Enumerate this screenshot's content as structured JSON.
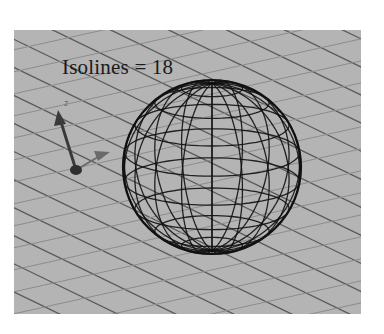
{
  "figure": {
    "caption": "Isolines = 18",
    "isolines": 18,
    "object": "wireframe-sphere",
    "colors": {
      "background": "#ffffff",
      "ground_plane": "#b4b4b4",
      "grid_dark": "#5a5a5a",
      "grid_light": "#8c8c8c",
      "wireframe": "#111111",
      "gizmo": "#3a3a3a"
    },
    "axis_gizmo": {
      "labels": [
        "z"
      ]
    }
  }
}
